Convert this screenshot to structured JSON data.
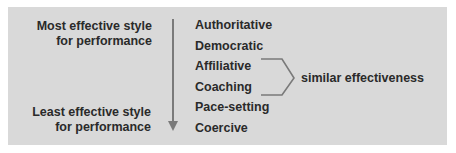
{
  "top_label": {
    "line1": "Most effective style",
    "line2": "for performance"
  },
  "bottom_label": {
    "line1": "Least effective style",
    "line2": "for performance"
  },
  "styles": [
    "Authoritative",
    "Democratic",
    "Affiliative",
    "Coaching",
    "Pace-setting",
    "Coercive"
  ],
  "bracket_label": "similar effectiveness",
  "colors": {
    "panel": "#d9d9d9",
    "arrow": "#7a7a7a",
    "text": "#2a2a2a"
  }
}
